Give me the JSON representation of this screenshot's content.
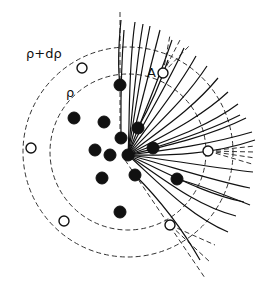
{
  "diagram": {
    "labels": {
      "outer_radius": "ρ+dρ",
      "inner_radius": "ρ",
      "marker": "A"
    },
    "center": {
      "x": 128,
      "y": 152
    },
    "circles": {
      "inner": {
        "r": 78,
        "style": "dashed"
      },
      "outer": {
        "r": 105,
        "style": "dashed"
      }
    },
    "solid_nodes": [
      {
        "x": 120,
        "y": 85
      },
      {
        "x": 74,
        "y": 118
      },
      {
        "x": 104,
        "y": 122
      },
      {
        "x": 121,
        "y": 138
      },
      {
        "x": 138,
        "y": 128
      },
      {
        "x": 95,
        "y": 150
      },
      {
        "x": 110,
        "y": 155
      },
      {
        "x": 128,
        "y": 155
      },
      {
        "x": 153,
        "y": 148
      },
      {
        "x": 135,
        "y": 175
      },
      {
        "x": 102,
        "y": 178
      },
      {
        "x": 177,
        "y": 179
      },
      {
        "x": 120,
        "y": 212
      }
    ],
    "open_nodes": [
      {
        "x": 82,
        "y": 68
      },
      {
        "x": 31,
        "y": 148
      },
      {
        "x": 208,
        "y": 151
      },
      {
        "x": 64,
        "y": 221
      },
      {
        "x": 170,
        "y": 225
      },
      {
        "x": 163,
        "y": 73
      }
    ],
    "colors": {
      "ink": "#111111",
      "background": "#ffffff"
    }
  }
}
